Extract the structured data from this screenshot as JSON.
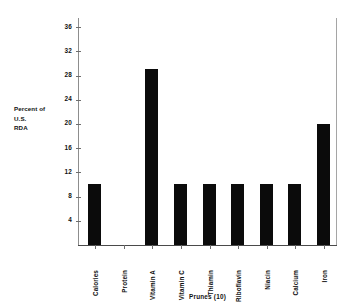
{
  "chart_data": {
    "type": "bar",
    "title": "",
    "xlabel": "Prunes (10)",
    "ylabel": "Percent of U.S. RDA",
    "ylabel_lines": [
      "Percent of",
      "U.S.",
      "RDA"
    ],
    "categories": [
      "Calories",
      "Protein",
      "Vitamin A",
      "Vitamin C",
      "Thiamin",
      "Riboflavin",
      "Niacin",
      "Calcium",
      "Iron"
    ],
    "values": [
      10,
      0,
      29,
      10,
      10,
      10,
      10,
      10,
      20
    ],
    "ylim": [
      0,
      37.5
    ],
    "yticks": [
      4,
      8,
      12,
      16,
      20,
      24,
      28,
      32,
      36
    ],
    "ytick_labels": [
      "4",
      "8",
      "12",
      "16",
      "20",
      "24",
      "28",
      "32",
      "36"
    ],
    "grid": false,
    "legend": false,
    "bar_color": "#0b0b0b",
    "background_color": "#ffffff",
    "axis_color": "#6d6d6d"
  }
}
